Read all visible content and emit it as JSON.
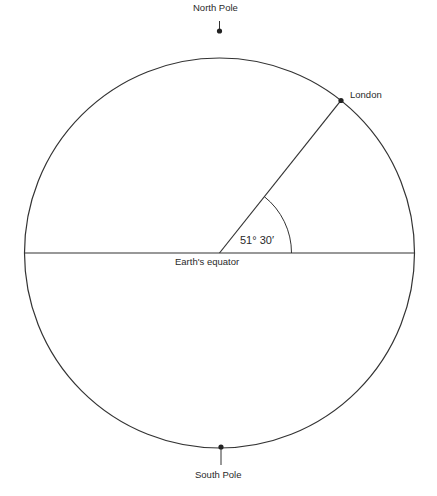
{
  "diagram": {
    "labels": {
      "north_pole": "North Pole",
      "south_pole": "South Pole",
      "london": "London",
      "equator": "Earth's equator",
      "angle": "51° 30′"
    },
    "geometry": {
      "center": [
        219.5,
        253
      ],
      "radius": 195,
      "latitude_deg": 51.5
    },
    "colors": {
      "line": "#333333",
      "background": "#ffffff"
    }
  }
}
